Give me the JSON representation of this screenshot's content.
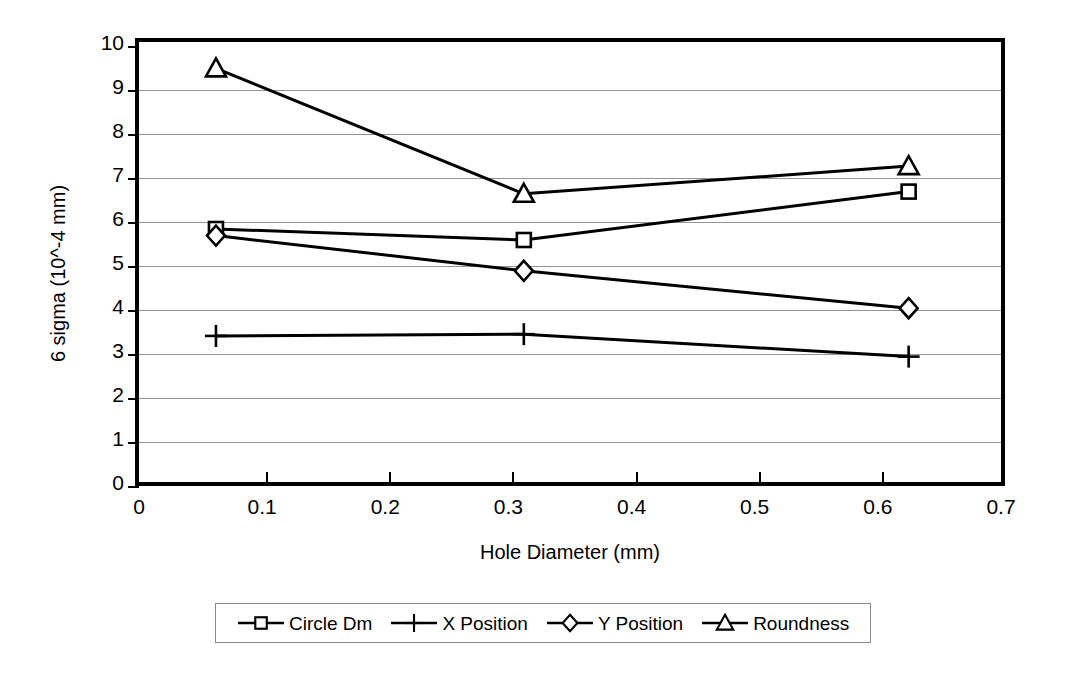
{
  "chart_data": {
    "type": "line",
    "title": "",
    "xlabel": "Hole Diameter (mm)",
    "ylabel": "6 sigma (10^-4 mm)",
    "xlim": [
      0,
      0.7
    ],
    "ylim": [
      0,
      10
    ],
    "xticks": [
      "0",
      "0.1",
      "0.2",
      "0.3",
      "0.4",
      "0.5",
      "0.6",
      "0.7"
    ],
    "xtick_values": [
      0,
      0.1,
      0.2,
      0.3,
      0.4,
      0.5,
      0.6,
      0.7
    ],
    "yticks": [
      "0",
      "1",
      "2",
      "3",
      "4",
      "5",
      "6",
      "7",
      "8",
      "9",
      "10"
    ],
    "ytick_values": [
      0,
      1,
      2,
      3,
      4,
      5,
      6,
      7,
      8,
      9,
      10
    ],
    "grid": "horizontal",
    "legend_position": "bottom",
    "x": [
      0.0625,
      0.3125,
      0.625
    ],
    "series": [
      {
        "name": "Circle Dm",
        "marker": "square",
        "values": [
          5.75,
          5.5,
          6.6
        ]
      },
      {
        "name": "X Position",
        "marker": "plus",
        "values": [
          3.32,
          3.36,
          2.85
        ]
      },
      {
        "name": "Y Position",
        "marker": "diamond",
        "values": [
          5.6,
          4.8,
          3.95
        ]
      },
      {
        "name": "Roundness",
        "marker": "triangle",
        "values": [
          9.4,
          6.55,
          7.18
        ]
      }
    ],
    "line_color": "#000000",
    "grid_color": "#949494",
    "frame_color": "#000000",
    "background_color": "#ffffff"
  },
  "legend": {
    "entries": [
      {
        "label": "Circle Dm",
        "marker": "square-marker-icon"
      },
      {
        "label": "X Position",
        "marker": "plus-marker-icon"
      },
      {
        "label": "Y Position",
        "marker": "diamond-marker-icon"
      },
      {
        "label": "Roundness",
        "marker": "triangle-marker-icon"
      }
    ]
  }
}
